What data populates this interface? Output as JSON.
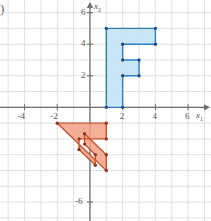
{
  "figure": {
    "label": ")",
    "background": "#ffffff",
    "grid_color": "#d9d9d9",
    "axis_color": "#6e6e6e"
  },
  "axes": {
    "x_axis_label": "x",
    "x_axis_sub": "1",
    "y_axis_label": "x",
    "y_axis_sub": "2",
    "x_ticks": [
      {
        "value": -4,
        "label": "-4"
      },
      {
        "value": -2,
        "label": "-2"
      },
      {
        "value": 2,
        "label": "2"
      },
      {
        "value": 4,
        "label": "4"
      },
      {
        "value": 6,
        "label": "6"
      }
    ],
    "y_ticks": [
      {
        "value": 6,
        "label": "6"
      },
      {
        "value": 4,
        "label": "4"
      },
      {
        "value": 2,
        "label": "2"
      },
      {
        "value": -6,
        "label": "-6"
      }
    ],
    "x_range": [
      -5.5,
      7.4
    ],
    "y_range": [
      -7.2,
      6.8
    ],
    "grid_step": 1
  },
  "chart_data": {
    "type": "scatter",
    "title": "",
    "xlabel": "x1",
    "ylabel": "x2",
    "grid": true,
    "legend": false,
    "xlim": [
      -5.5,
      7.4
    ],
    "ylim": [
      -7.2,
      6.8
    ],
    "shapes": [
      {
        "name": "original-F",
        "color": "#2f7fc1",
        "fill": "#bfe2f5",
        "fill_opacity": 0.85,
        "stroke": "#2f7fc1",
        "vertex_color": "#1f4f82",
        "points": [
          [
            1,
            0
          ],
          [
            1,
            5
          ],
          [
            4,
            5
          ],
          [
            4,
            4
          ],
          [
            2,
            4
          ],
          [
            2,
            3
          ],
          [
            3,
            3
          ],
          [
            3,
            2
          ],
          [
            2,
            2
          ],
          [
            2,
            0
          ]
        ]
      },
      {
        "name": "transformed-F",
        "color": "#d9603f",
        "fill": "#f3a184",
        "fill_opacity": 0.85,
        "stroke": "#c9522f",
        "vertex_color": "#8c3a22",
        "points": [
          [
            -2,
            -1
          ],
          [
            1,
            -4
          ],
          [
            1,
            -3
          ],
          [
            -0.33,
            -1.67
          ],
          [
            -0.33,
            -2.33
          ],
          [
            0.33,
            -3
          ],
          [
            0.33,
            -3.67
          ],
          [
            -0.67,
            -2.67
          ],
          [
            -0.67,
            -2
          ],
          [
            1,
            -2
          ],
          [
            1,
            -1
          ]
        ]
      }
    ]
  }
}
